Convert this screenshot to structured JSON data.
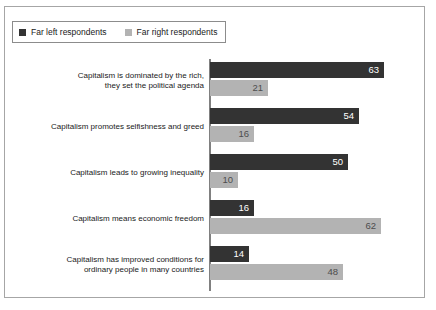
{
  "legend": {
    "entries": [
      {
        "label": "Far left respondents",
        "color": "#333333",
        "icon": "square-swatch"
      },
      {
        "label": "Far right respondents",
        "color": "#b3b3b3",
        "icon": "square-swatch"
      }
    ]
  },
  "chart_data": {
    "type": "bar",
    "orientation": "horizontal",
    "title": "",
    "subtitle": "",
    "xlabel": "",
    "ylabel": "",
    "xlim": [
      0,
      70
    ],
    "grid": false,
    "legend_position": "top-left",
    "categories": [
      "Capitalism is dominated by the rich, they set the political agenda",
      "Capitalism promotes selfishness and greed",
      "Capitalism leads to growing inequality",
      "Capitalism means economic freedom",
      "Capitalism has improved conditions for ordinary people in many countries"
    ],
    "category_lines": [
      [
        "Capitalism is dominated by the rich,",
        "they set the political agenda"
      ],
      [
        "Capitalism promotes selfishness and greed"
      ],
      [
        "Capitalism leads to growing inequality"
      ],
      [
        "Capitalism means economic freedom"
      ],
      [
        "Capitalism has improved conditions for",
        "ordinary people in many countries"
      ]
    ],
    "series": [
      {
        "name": "Far left respondents",
        "color": "#333333",
        "values": [
          63,
          54,
          50,
          16,
          14
        ]
      },
      {
        "name": "Far right respondents",
        "color": "#b3b3b3",
        "values": [
          21,
          16,
          10,
          62,
          48
        ]
      }
    ]
  },
  "colors": {
    "far_left": "#333333",
    "far_right": "#b3b3b3",
    "frame": "#a6a6a6",
    "axis": "#808080",
    "background": "#ffffff"
  }
}
